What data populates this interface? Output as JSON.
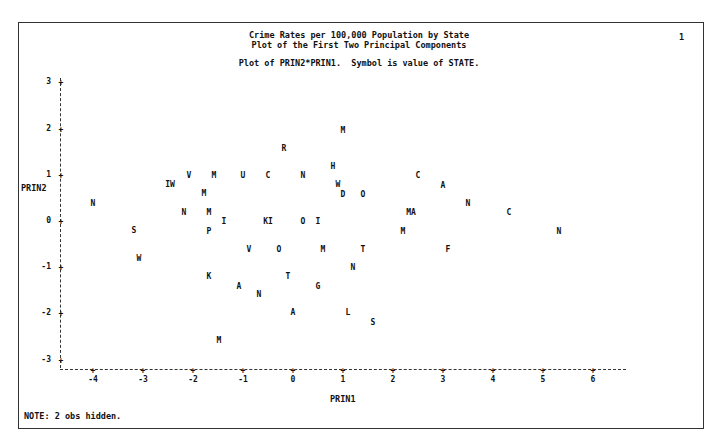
{
  "page": {
    "title_line1": "Crime Rates per 100,000 Population by State",
    "title_line2": "Plot of the First Two Principal Components",
    "subtitle": "Plot of PRIN2*PRIN1.  Symbol is value of STATE.",
    "page_number": "1",
    "note": "NOTE: 2 obs hidden.",
    "xlabel": "PRIN1",
    "ylabel": "PRIN2"
  },
  "chart_data": {
    "type": "scatter",
    "title": "Crime Rates per 100,000 Population by State",
    "subtitle": "Plot of the First Two Principal Components",
    "xlabel": "PRIN1",
    "ylabel": "PRIN2",
    "xlim": [
      -4.6,
      6.7
    ],
    "ylim": [
      -3.2,
      3
    ],
    "xticks": [
      "-4",
      "-3",
      "-2",
      "-1",
      "0",
      "1",
      "2",
      "3",
      "4",
      "5",
      "6"
    ],
    "yticks": [
      "3",
      "2",
      "1",
      "0",
      "-1",
      "-2",
      "-3"
    ],
    "grid": false,
    "legend": "Symbol is value of STATE",
    "note": "2 obs hidden",
    "points": [
      {
        "label": "M",
        "x": 1.0,
        "y": 1.97
      },
      {
        "label": "R",
        "x": -0.18,
        "y": 1.58
      },
      {
        "label": "H",
        "x": 0.8,
        "y": 1.18
      },
      {
        "label": "C",
        "x": -0.5,
        "y": 0.99
      },
      {
        "label": "D",
        "x": 1.0,
        "y": 0.58
      },
      {
        "label": "C",
        "x": 2.5,
        "y": 0.99
      },
      {
        "label": "A",
        "x": 3.0,
        "y": 0.77
      },
      {
        "label": "N",
        "x": 3.5,
        "y": 0.39
      },
      {
        "label": "C",
        "x": 4.32,
        "y": 0.19
      },
      {
        "label": "N",
        "x": 5.32,
        "y": -0.21
      },
      {
        "label": "V",
        "x": -2.08,
        "y": 0.99
      },
      {
        "label": "M",
        "x": -1.58,
        "y": 0.99
      },
      {
        "label": "U",
        "x": -1.0,
        "y": 0.99
      },
      {
        "label": "N",
        "x": 0.2,
        "y": 0.99
      },
      {
        "label": "W",
        "x": 0.9,
        "y": 0.8
      },
      {
        "label": "O",
        "x": 1.4,
        "y": 0.58
      },
      {
        "label": "IW",
        "x": -2.46,
        "y": 0.8
      },
      {
        "label": "M",
        "x": -1.78,
        "y": 0.6
      },
      {
        "label": "N",
        "x": -4.0,
        "y": 0.39
      },
      {
        "label": "N",
        "x": -2.18,
        "y": 0.19
      },
      {
        "label": "M",
        "x": -1.68,
        "y": 0.19
      },
      {
        "label": "MA",
        "x": 2.36,
        "y": 0.19
      },
      {
        "label": "I",
        "x": -1.38,
        "y": 0.0
      },
      {
        "label": "KI",
        "x": -0.5,
        "y": 0.0
      },
      {
        "label": "O",
        "x": 0.2,
        "y": 0.0
      },
      {
        "label": "I",
        "x": 0.5,
        "y": 0.0
      },
      {
        "label": "P",
        "x": -1.68,
        "y": -0.21
      },
      {
        "label": "M",
        "x": 2.2,
        "y": -0.21
      },
      {
        "label": "S",
        "x": -3.18,
        "y": -0.19
      },
      {
        "label": "W",
        "x": -3.08,
        "y": -0.8
      },
      {
        "label": "V",
        "x": -0.88,
        "y": -0.6
      },
      {
        "label": "O",
        "x": -0.28,
        "y": -0.6
      },
      {
        "label": "M",
        "x": 0.6,
        "y": -0.6
      },
      {
        "label": "T",
        "x": 1.4,
        "y": -0.6
      },
      {
        "label": "F",
        "x": 3.1,
        "y": -0.6
      },
      {
        "label": "N",
        "x": 1.2,
        "y": -0.99
      },
      {
        "label": "K",
        "x": -1.68,
        "y": -1.2
      },
      {
        "label": "T",
        "x": -0.1,
        "y": -1.18
      },
      {
        "label": "A",
        "x": -1.08,
        "y": -1.4
      },
      {
        "label": "G",
        "x": 0.5,
        "y": -1.4
      },
      {
        "label": "N",
        "x": -0.68,
        "y": -1.59
      },
      {
        "label": "A",
        "x": 0.0,
        "y": -1.98
      },
      {
        "label": "L",
        "x": 1.1,
        "y": -1.98
      },
      {
        "label": "S",
        "x": 1.6,
        "y": -2.19
      },
      {
        "label": "M",
        "x": -1.48,
        "y": -2.58
      }
    ]
  }
}
